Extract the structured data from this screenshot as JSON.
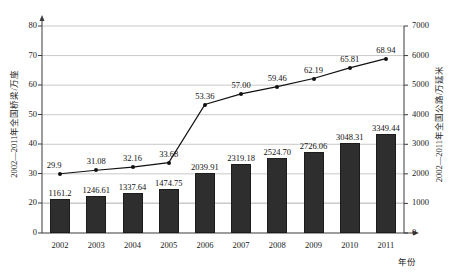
{
  "chart_data": {
    "type": "bar",
    "title": "",
    "subtitle": "",
    "xlabel": "年份",
    "ylabel": "2002—2011年全国桥梁/万座",
    "y2label": "2002—2011年全国公路/万延米",
    "categories": [
      "2002",
      "2003",
      "2004",
      "2005",
      "2006",
      "2007",
      "2008",
      "2009",
      "2010",
      "2011"
    ],
    "ylim": [
      0,
      80
    ],
    "y2lim": [
      0,
      7000
    ],
    "yticks": [
      "0",
      "20",
      "30",
      "40",
      "50",
      "60",
      "70",
      "80"
    ],
    "y2ticks": [
      "0",
      "1000",
      "2000",
      "3000",
      "4000",
      "5000",
      "6000",
      "7000"
    ],
    "grid": true,
    "legend": "none",
    "series": [
      {
        "name": "全国公路/万延米",
        "type": "bar",
        "axis": "right",
        "values": [
          1161.2,
          1246.61,
          1337.64,
          1474.75,
          2039.91,
          2319.18,
          2524.7,
          2726.06,
          3048.31,
          3349.44
        ],
        "labels": [
          "1161.2",
          "1246.61",
          "1337.64",
          "1474.75",
          "2039.91",
          "2319.18",
          "2524.70",
          "2726.06",
          "3048.31",
          "3349.44"
        ],
        "color": "#2e2e2e"
      },
      {
        "name": "全国桥梁/万座",
        "type": "line",
        "axis": "left",
        "values": [
          29.9,
          31.08,
          32.16,
          33.68,
          53.36,
          57.0,
          59.46,
          62.19,
          65.81,
          68.94
        ],
        "labels": [
          "29.9",
          "31.08",
          "32.16",
          "33.68",
          "53.36",
          "57.00",
          "59.46",
          "62.19",
          "65.81",
          "68.94"
        ],
        "color": "#111111"
      }
    ]
  },
  "axes": {
    "left_title": "2002—2011年全国桥梁/万座",
    "right_title": "2002—2011年全国公路/万延米",
    "x_title": "年份",
    "left_ticks": [
      "80",
      "70",
      "60",
      "50",
      "40",
      "30",
      "20",
      "0"
    ],
    "right_ticks": [
      "7000",
      "6000",
      "5000",
      "4000",
      "3000",
      "2000",
      "1000",
      "0"
    ],
    "x_ticks": [
      "2002",
      "2003",
      "2004",
      "2005",
      "2006",
      "2007",
      "2008",
      "2009",
      "2010",
      "2011"
    ]
  },
  "bars": {
    "labels": [
      "1161.2",
      "1246.61",
      "1337.64",
      "1474.75",
      "2039.91",
      "2319.18",
      "2524.70",
      "2726.06",
      "3048.31",
      "3349.44"
    ]
  },
  "line": {
    "labels": [
      "29.9",
      "31.08",
      "32.16",
      "33.68",
      "53.36",
      "57.00",
      "59.46",
      "62.19",
      "65.81",
      "68.94"
    ]
  }
}
